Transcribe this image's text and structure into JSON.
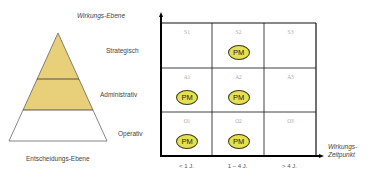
{
  "pyramid": {
    "title": "Entscheidungs-Ebene",
    "fill_color": "#e8cf7a",
    "levels": [
      {
        "label": "Strategisch",
        "filled": true
      },
      {
        "label": "Administrativ",
        "filled": true
      },
      {
        "label": "Operativ",
        "filled": false
      }
    ]
  },
  "matrix": {
    "y_axis_label": "Wirkungs-Ebene",
    "x_axis_label_line1": "Wirkungs-",
    "x_axis_label_line2": "Zeitpunkt",
    "columns": [
      "< 1 J.",
      "1 – 4 J.",
      "> 4 J."
    ],
    "rows": [
      {
        "level": "Strategisch",
        "cells": [
          {
            "code": "S1",
            "pm": false
          },
          {
            "code": "S2",
            "pm": true
          },
          {
            "code": "S3",
            "pm": false
          }
        ]
      },
      {
        "level": "Administrativ",
        "cells": [
          {
            "code": "A1",
            "pm": true
          },
          {
            "code": "A2",
            "pm": true
          },
          {
            "code": "A3",
            "pm": false
          }
        ]
      },
      {
        "level": "Operativ",
        "cells": [
          {
            "code": "O1",
            "pm": true
          },
          {
            "code": "O2",
            "pm": true
          },
          {
            "code": "O3",
            "pm": false
          }
        ]
      }
    ],
    "marker_label": "PM",
    "marker_color": "#e6e050"
  }
}
